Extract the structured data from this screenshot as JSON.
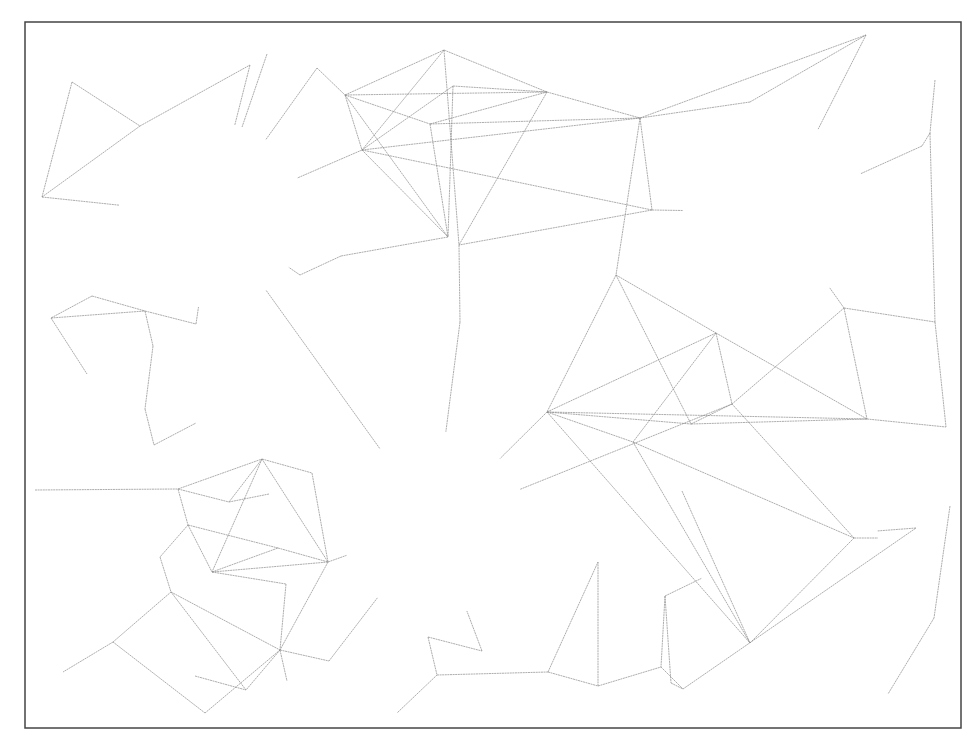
{
  "diagram": {
    "type": "social-network-illustration",
    "canvas": {
      "width": 979,
      "height": 747
    },
    "frame": {
      "x": 25,
      "y": 22,
      "width": 936,
      "height": 706
    },
    "colors": {
      "edge": "#8a8a8a",
      "ring": "#2e2e2e",
      "person_fill": "#e2e2e2",
      "person_stroke": "#3a3a3a",
      "roof_dark": "#3d3d3d",
      "wall_light": "#bdbdbd",
      "wall_mid": "#8f8f8f"
    },
    "hubs": [
      {
        "id": "hub-houses",
        "label": "houses",
        "icon": "house-icon",
        "cx": 212,
        "cy": 215,
        "r": 93
      },
      {
        "id": "hub-school",
        "label": "school",
        "icon": "school-icon",
        "cx": 776,
        "cy": 212,
        "r": 93
      },
      {
        "id": "hub-office",
        "label": "office tower",
        "icon": "office-building-icon",
        "cx": 434,
        "cy": 524,
        "r": 93
      },
      {
        "id": "hub-store",
        "label": "store",
        "icon": "store-icon",
        "cx": 785,
        "cy": 538,
        "r": 93
      }
    ],
    "vehicles": [
      {
        "id": "plane",
        "icon": "airplane-icon",
        "x": 270,
        "y": 368
      },
      {
        "id": "train",
        "icon": "train-icon",
        "x": 556,
        "y": 370
      },
      {
        "id": "car",
        "icon": "car-icon",
        "x": 888,
        "y": 365
      }
    ],
    "crowd": {
      "id": "crowd",
      "icon": "crowd-icon",
      "x": 460,
      "y": 322
    },
    "nodes": [
      [
        72,
        82
      ],
      [
        140,
        126
      ],
      [
        42,
        197
      ],
      [
        250,
        65
      ],
      [
        267,
        54
      ],
      [
        317,
        68
      ],
      [
        345,
        95
      ],
      [
        444,
        50
      ],
      [
        453,
        86
      ],
      [
        430,
        124
      ],
      [
        362,
        150
      ],
      [
        547,
        92
      ],
      [
        640,
        118
      ],
      [
        652,
        210
      ],
      [
        448,
        237
      ],
      [
        459,
        245
      ],
      [
        341,
        256
      ],
      [
        300,
        275
      ],
      [
        750,
        102
      ],
      [
        866,
        35
      ],
      [
        935,
        80
      ],
      [
        930,
        133
      ],
      [
        922,
        146
      ],
      [
        92,
        296
      ],
      [
        51,
        318
      ],
      [
        145,
        311
      ],
      [
        196,
        324
      ],
      [
        153,
        346
      ],
      [
        87,
        374
      ],
      [
        145,
        409
      ],
      [
        196,
        423
      ],
      [
        154,
        445
      ],
      [
        616,
        275
      ],
      [
        716,
        333
      ],
      [
        844,
        308
      ],
      [
        935,
        322
      ],
      [
        547,
        412
      ],
      [
        732,
        404
      ],
      [
        691,
        424
      ],
      [
        633,
        442
      ],
      [
        867,
        419
      ],
      [
        946,
        427
      ],
      [
        35,
        490
      ],
      [
        178,
        489
      ],
      [
        262,
        459
      ],
      [
        312,
        473
      ],
      [
        269,
        494
      ],
      [
        229,
        502
      ],
      [
        188,
        525
      ],
      [
        160,
        557
      ],
      [
        212,
        572
      ],
      [
        278,
        548
      ],
      [
        328,
        562
      ],
      [
        171,
        592
      ],
      [
        286,
        584
      ],
      [
        280,
        650
      ],
      [
        195,
        676
      ],
      [
        246,
        690
      ],
      [
        287,
        681
      ],
      [
        329,
        661
      ],
      [
        113,
        642
      ],
      [
        63,
        672
      ],
      [
        205,
        713
      ],
      [
        375,
        560
      ],
      [
        379,
        627
      ],
      [
        428,
        637
      ],
      [
        437,
        675
      ],
      [
        482,
        651
      ],
      [
        397,
        713
      ],
      [
        548,
        672
      ],
      [
        556,
        706
      ],
      [
        598,
        562
      ],
      [
        598,
        686
      ],
      [
        665,
        596
      ],
      [
        661,
        667
      ],
      [
        671,
        683
      ],
      [
        683,
        689
      ],
      [
        640,
        512
      ],
      [
        682,
        491
      ],
      [
        750,
        643
      ],
      [
        854,
        538
      ],
      [
        916,
        528
      ],
      [
        950,
        506
      ],
      [
        934,
        618
      ],
      [
        888,
        694
      ]
    ],
    "hub_members": [
      [
        141,
        190
      ],
      [
        264,
        184
      ],
      [
        276,
        180
      ],
      [
        289,
        188
      ],
      [
        141,
        235
      ],
      [
        163,
        250
      ],
      [
        278,
        222
      ],
      [
        292,
        241
      ],
      [
        263,
        258
      ],
      [
        273,
        251
      ],
      [
        174,
        272
      ],
      [
        186,
        283
      ],
      [
        215,
        281
      ],
      [
        240,
        288
      ],
      [
        704,
        236
      ],
      [
        770,
        236
      ],
      [
        797,
        246
      ],
      [
        848,
        262
      ],
      [
        731,
        272
      ],
      [
        757,
        275
      ],
      [
        784,
        275
      ],
      [
        803,
        270
      ],
      [
        704,
        270
      ],
      [
        714,
        262
      ],
      [
        772,
        294
      ],
      [
        722,
        576
      ],
      [
        752,
        606
      ],
      [
        793,
        620
      ],
      [
        839,
        600
      ],
      [
        856,
        538
      ]
    ],
    "edges": [
      [
        0,
        1
      ],
      [
        0,
        2
      ],
      [
        1,
        3
      ],
      [
        1,
        2
      ],
      [
        2,
        "hub-houses"
      ],
      [
        3,
        "hub-houses"
      ],
      [
        4,
        "hub-houses"
      ],
      [
        5,
        6
      ],
      [
        6,
        7
      ],
      [
        6,
        11
      ],
      [
        6,
        10
      ],
      [
        6,
        9
      ],
      [
        6,
        14
      ],
      [
        7,
        10
      ],
      [
        7,
        11
      ],
      [
        7,
        15
      ],
      [
        8,
        11
      ],
      [
        8,
        14
      ],
      [
        8,
        10
      ],
      [
        9,
        12
      ],
      [
        9,
        14
      ],
      [
        9,
        11
      ],
      [
        10,
        12
      ],
      [
        10,
        13
      ],
      [
        10,
        14
      ],
      [
        10,
        "hub-houses"
      ],
      [
        11,
        12
      ],
      [
        11,
        15
      ],
      [
        12,
        13
      ],
      [
        12,
        18
      ],
      [
        12,
        19
      ],
      [
        12,
        32
      ],
      [
        13,
        15
      ],
      [
        13,
        "hub-school"
      ],
      [
        18,
        19
      ],
      [
        19,
        "hub-school"
      ],
      [
        14,
        16
      ],
      [
        16,
        17
      ],
      [
        17,
        "hub-houses"
      ],
      [
        5,
        "hub-houses"
      ],
      [
        20,
        21
      ],
      [
        21,
        22
      ],
      [
        22,
        "hub-school"
      ],
      [
        21,
        35
      ],
      [
        35,
        41
      ],
      [
        34,
        35
      ],
      [
        23,
        24
      ],
      [
        23,
        25
      ],
      [
        24,
        25
      ],
      [
        24,
        28
      ],
      [
        25,
        26
      ],
      [
        25,
        27
      ],
      [
        27,
        29
      ],
      [
        29,
        31
      ],
      [
        31,
        30
      ],
      [
        26,
        "hub-houses"
      ],
      [
        "hub-houses",
        "hub-office"
      ],
      [
        32,
        36
      ],
      [
        32,
        38
      ],
      [
        32,
        33
      ],
      [
        33,
        36
      ],
      [
        33,
        39
      ],
      [
        33,
        40
      ],
      [
        33,
        37
      ],
      [
        34,
        40
      ],
      [
        34,
        37
      ],
      [
        34,
        "hub-school"
      ],
      [
        36,
        40
      ],
      [
        36,
        38
      ],
      [
        36,
        39
      ],
      [
        36,
        79
      ],
      [
        38,
        37
      ],
      [
        38,
        40
      ],
      [
        39,
        79
      ],
      [
        39,
        80
      ],
      [
        37,
        80
      ],
      [
        40,
        41
      ],
      [
        37,
        "hub-office"
      ],
      [
        36,
        "hub-office"
      ],
      [
        15,
        "crowd"
      ],
      [
        "crowd",
        "hub-office"
      ],
      [
        42,
        43
      ],
      [
        43,
        44
      ],
      [
        43,
        47
      ],
      [
        43,
        48
      ],
      [
        44,
        45
      ],
      [
        44,
        47
      ],
      [
        44,
        52
      ],
      [
        44,
        50
      ],
      [
        45,
        52
      ],
      [
        46,
        47
      ],
      [
        48,
        50
      ],
      [
        48,
        51
      ],
      [
        48,
        49
      ],
      [
        49,
        53
      ],
      [
        50,
        52
      ],
      [
        50,
        51
      ],
      [
        50,
        54
      ],
      [
        51,
        52
      ],
      [
        52,
        55
      ],
      [
        53,
        55
      ],
      [
        53,
        60
      ],
      [
        53,
        57
      ],
      [
        54,
        55
      ],
      [
        55,
        57
      ],
      [
        55,
        58
      ],
      [
        55,
        59
      ],
      [
        55,
        62
      ],
      [
        56,
        57
      ],
      [
        60,
        61
      ],
      [
        60,
        62
      ],
      [
        59,
        "hub-office"
      ],
      [
        52,
        "hub-office"
      ],
      [
        65,
        66
      ],
      [
        65,
        67
      ],
      [
        66,
        68
      ],
      [
        67,
        "hub-office"
      ],
      [
        66,
        69
      ],
      [
        69,
        71
      ],
      [
        69,
        72
      ],
      [
        72,
        71
      ],
      [
        72,
        74
      ],
      [
        73,
        74
      ],
      [
        73,
        75
      ],
      [
        73,
        "hub-store"
      ],
      [
        74,
        76
      ],
      [
        75,
        76
      ],
      [
        76,
        81
      ],
      [
        81,
        "hub-store"
      ],
      [
        78,
        79
      ],
      [
        79,
        80
      ],
      [
        80,
        "hub-store"
      ],
      [
        82,
        83
      ],
      [
        83,
        84
      ],
      [
        83,
        85
      ],
      [
        82,
        85
      ],
      [
        82,
        "hub-store"
      ],
      [
        86,
        "hub-store"
      ],
      [
        71,
        73
      ],
      [
        63,
        "hub-office"
      ],
      [
        64,
        65
      ],
      [
        41,
        84
      ],
      [
        40,
        "hub-store"
      ],
      [
        78,
        "hub-office"
      ]
    ]
  }
}
